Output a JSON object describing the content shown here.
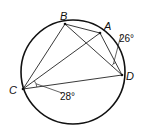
{
  "diagram": {
    "type": "inscribed-quadrilateral",
    "circle": {
      "cx": 73,
      "cy": 72,
      "r": 52
    },
    "points": [
      {
        "id": "B",
        "label": "B",
        "x": 65,
        "y": 24,
        "lx": 60,
        "ly": 20
      },
      {
        "id": "A",
        "label": "A",
        "x": 100,
        "y": 33,
        "lx": 104,
        "ly": 30
      },
      {
        "id": "D",
        "label": "D",
        "x": 122,
        "y": 75,
        "lx": 126,
        "ly": 80
      },
      {
        "id": "C",
        "label": "C",
        "x": 23,
        "y": 89,
        "lx": 9,
        "ly": 94
      }
    ],
    "segments": [
      [
        "B",
        "A"
      ],
      [
        "A",
        "D"
      ],
      [
        "B",
        "D"
      ],
      [
        "B",
        "C"
      ],
      [
        "C",
        "A"
      ],
      [
        "C",
        "D"
      ]
    ],
    "angles": [
      {
        "vertex": "D",
        "between": [
          "A",
          "B"
        ],
        "value": "26°",
        "text": "26°",
        "lx": 119,
        "ly": 42
      },
      {
        "vertex": "C",
        "between": [
          "A",
          "D"
        ],
        "value": "28°",
        "text": "28°",
        "lx": 60,
        "ly": 100
      }
    ]
  }
}
